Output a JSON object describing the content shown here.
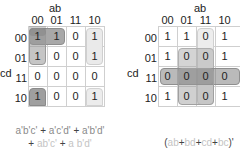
{
  "left_map": {
    "col_var": "ab",
    "row_var": "cd",
    "col_headers": [
      "00",
      "01",
      "11",
      "10"
    ],
    "row_headers": [
      "00",
      "01",
      "11",
      "10"
    ],
    "cells": [
      [
        "1",
        "1",
        "0",
        "1"
      ],
      [
        "1",
        "0",
        "0",
        "1"
      ],
      [
        "0",
        "0",
        "0",
        "0"
      ],
      [
        "1",
        "0",
        "0",
        "1"
      ]
    ],
    "formula": {
      "line1": [
        {
          "text": "a'b'c'",
          "tone": "dark"
        },
        {
          "text": " + ",
          "tone": "plus"
        },
        {
          "text": "a'c'd'",
          "tone": "dark"
        },
        {
          "text": " + ",
          "tone": "plus"
        },
        {
          "text": "a'b'd'",
          "tone": "dark"
        }
      ],
      "line2": [
        {
          "text": "+ ",
          "tone": "plus"
        },
        {
          "text": "ab'c'",
          "tone": "light"
        },
        {
          "text": " + ",
          "tone": "plus"
        },
        {
          "text": "a b'd'",
          "tone": "light"
        }
      ]
    }
  },
  "right_map": {
    "col_var": "ab",
    "row_var": "cd",
    "col_headers": [
      "00",
      "01",
      "11",
      "10"
    ],
    "row_headers": [
      "00",
      "01",
      "11",
      "10"
    ],
    "cells": [
      [
        "1",
        "1",
        "0",
        "1"
      ],
      [
        "1",
        "0",
        "0",
        "1"
      ],
      [
        "0",
        "0",
        "0",
        "0"
      ],
      [
        "1",
        "0",
        "0",
        "1"
      ]
    ],
    "formula": {
      "parts": [
        {
          "text": "(",
          "tone": "plus"
        },
        {
          "text": "ab",
          "tone": "light"
        },
        {
          "text": "+",
          "tone": "plus"
        },
        {
          "text": "bd",
          "tone": "light"
        },
        {
          "text": "+",
          "tone": "plus"
        },
        {
          "text": "cd",
          "tone": "light"
        },
        {
          "text": "+",
          "tone": "plus"
        },
        {
          "text": "bc",
          "tone": "light"
        },
        {
          "text": ")'",
          "tone": "plus"
        }
      ]
    }
  },
  "colors": {
    "group_dark": "#9a9a9a",
    "group_mid": "#bdbdbd",
    "group_light": "#e6e6e6",
    "grid_line": "#cfcfcf"
  }
}
